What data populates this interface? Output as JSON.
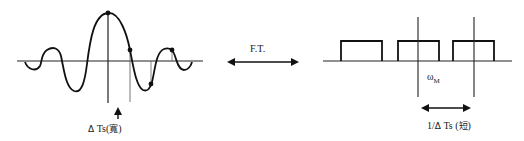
{
  "diagram": {
    "left_panel": {
      "name": "time-domain sinc waveform",
      "annotation_arrow": "up",
      "label": {
        "delta": "Δ",
        "text": " Ts(",
        "cjk": "寬",
        "close": ")"
      }
    },
    "center": {
      "arrow": "double-headed",
      "label": "F.T."
    },
    "right_panel": {
      "name": "frequency-domain periodic rectangular spectrum",
      "rect_count": 3,
      "omega_label": {
        "symbol": "ω",
        "subscript": "M"
      },
      "period_label": {
        "prefix": "1/",
        "delta": "Δ",
        "text": " Ts (",
        "cjk": "短",
        "close": ")"
      }
    },
    "colors": {
      "stroke": "#111111",
      "guide": "#555555",
      "background": "#ffffff"
    }
  }
}
